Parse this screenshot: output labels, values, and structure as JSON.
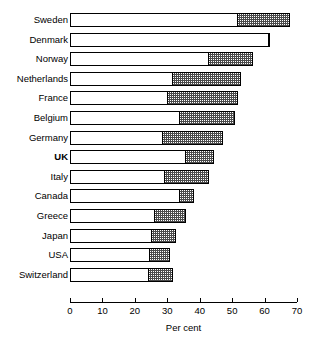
{
  "chart_data": {
    "type": "bar",
    "orientation": "horizontal",
    "stacked": true,
    "title": "",
    "subtitle": "",
    "xlabel": "Per cent",
    "ylabel": "",
    "xlim": [
      0,
      70
    ],
    "grid": false,
    "legend": null,
    "ticks": [
      0,
      10,
      20,
      30,
      40,
      50,
      60,
      70
    ],
    "tick_labels": [
      "0",
      "10",
      "20",
      "30",
      "40",
      "50",
      "60",
      "70"
    ],
    "categories": [
      "Sweden",
      "Denmark",
      "Norway",
      "Netherlands",
      "France",
      "Belgium",
      "Germany",
      "UK",
      "Italy",
      "Canada",
      "Greece",
      "Japan",
      "USA",
      "Switzerland"
    ],
    "emphasis_category": "UK",
    "series": [
      {
        "name": "segment-a",
        "fill": "white",
        "values": [
          51.5,
          61.0,
          42.5,
          31.5,
          30.0,
          33.5,
          28.5,
          35.5,
          29.0,
          33.5,
          26.0,
          25.0,
          24.5,
          24.0
        ]
      },
      {
        "name": "segment-b",
        "fill": "hatched-grey",
        "values": [
          16.0,
          0.5,
          13.5,
          21.0,
          21.5,
          17.0,
          18.5,
          8.5,
          13.5,
          4.5,
          9.5,
          7.5,
          6.0,
          7.5
        ]
      }
    ],
    "totals": [
      67.5,
      61.5,
      56.0,
      52.5,
      51.5,
      50.5,
      47.0,
      44.0,
      42.5,
      38.0,
      35.5,
      32.5,
      30.5,
      31.5
    ]
  }
}
